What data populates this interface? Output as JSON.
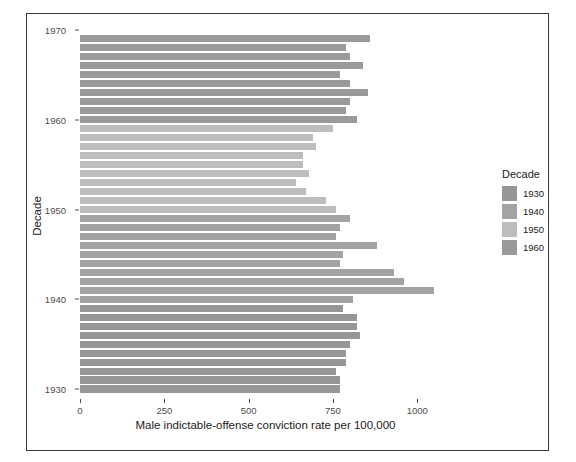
{
  "chart_data": {
    "type": "bar",
    "orientation": "horizontal",
    "title": "",
    "xlabel": "Male indictable-offense conviction rate per 100,000",
    "ylabel": "Decade",
    "xlim": [
      0,
      1100
    ],
    "ylim": [
      1929,
      1971
    ],
    "grid": false,
    "x_ticks": [
      0,
      250,
      500,
      750,
      1000
    ],
    "x_tick_labels": [
      "0",
      "250",
      "500",
      "750",
      "1000"
    ],
    "y_ticks": [
      1930,
      1940,
      1950,
      1960,
      1970
    ],
    "y_tick_labels": [
      "1930",
      "1940",
      "1950",
      "1960",
      "1970"
    ],
    "legend": {
      "title": "Decade",
      "position": "right",
      "entries": [
        {
          "label": "1930",
          "color": "#969696"
        },
        {
          "label": "1940",
          "color": "#a3a3a3"
        },
        {
          "label": "1950",
          "color": "#bdbdbd"
        },
        {
          "label": "1960",
          "color": "#9a9a9a"
        }
      ]
    },
    "categories": [
      1969,
      1968,
      1967,
      1966,
      1965,
      1964,
      1963,
      1962,
      1961,
      1960,
      1959,
      1958,
      1957,
      1956,
      1955,
      1954,
      1953,
      1952,
      1951,
      1950,
      1949,
      1948,
      1947,
      1946,
      1945,
      1944,
      1943,
      1942,
      1941,
      1940,
      1939,
      1938,
      1937,
      1936,
      1935,
      1934,
      1933,
      1932,
      1931,
      1930
    ],
    "values": [
      860,
      790,
      800,
      840,
      770,
      800,
      855,
      800,
      790,
      820,
      750,
      690,
      700,
      660,
      660,
      680,
      640,
      670,
      730,
      760,
      800,
      770,
      760,
      880,
      780,
      770,
      930,
      960,
      1050,
      810,
      780,
      820,
      820,
      830,
      800,
      790,
      790,
      760,
      770,
      770
    ],
    "value_decades": [
      1960,
      1960,
      1960,
      1960,
      1960,
      1960,
      1960,
      1960,
      1960,
      1960,
      1950,
      1950,
      1950,
      1950,
      1950,
      1950,
      1950,
      1950,
      1950,
      1950,
      1940,
      1940,
      1940,
      1940,
      1940,
      1940,
      1940,
      1940,
      1940,
      1940,
      1930,
      1930,
      1930,
      1930,
      1930,
      1930,
      1930,
      1930,
      1930,
      1930
    ]
  }
}
